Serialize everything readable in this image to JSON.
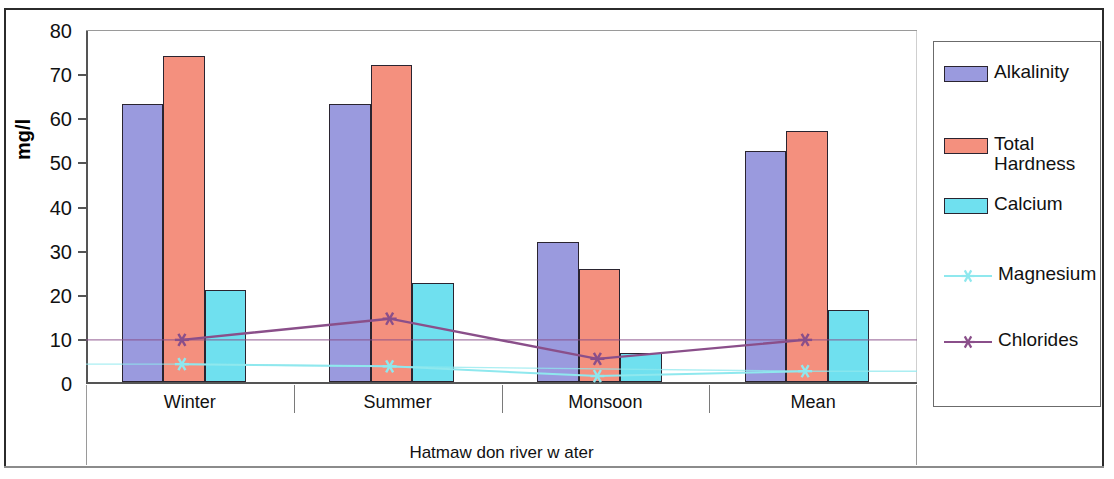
{
  "chart_data": {
    "type": "bar",
    "title": "",
    "xlabel": "Hatmaw don river w ater",
    "ylabel": "mg/l",
    "ylim": [
      0,
      80
    ],
    "yticks": [
      0,
      10,
      20,
      30,
      40,
      50,
      60,
      70,
      80
    ],
    "grid": false,
    "legend_position": "right",
    "categories": [
      "Winter",
      "Summer",
      "Monsoon",
      "Mean"
    ],
    "series": [
      {
        "name": "Alkalinity",
        "kind": "bar",
        "color": "#9a9ade",
        "values": [
          63,
          63,
          31.8,
          52.4
        ]
      },
      {
        "name": "Total Hardness",
        "kind": "bar",
        "color": "#f4907e",
        "values": [
          73.8,
          71.8,
          25.6,
          57
        ]
      },
      {
        "name": "Calcium",
        "kind": "bar",
        "color": "#6fe0ef",
        "values": [
          20.8,
          22.4,
          6.5,
          16.3
        ]
      },
      {
        "name": "Magnesium",
        "kind": "line",
        "color": "#8fe8ee",
        "values": [
          4.5,
          4,
          1.8,
          2.9
        ]
      },
      {
        "name": "Chlorides",
        "kind": "line",
        "color": "#8a4f8a",
        "values": [
          10,
          14.8,
          5.7,
          10
        ]
      }
    ]
  },
  "legend": {
    "items": [
      {
        "label": "Alkalinity",
        "marker": "swatch-alkalinity"
      },
      {
        "label": "Total\nHardness",
        "marker": "swatch-hardness"
      },
      {
        "label": "Calcium",
        "marker": "swatch-calcium"
      },
      {
        "label": "Magnesium",
        "marker": "line-marker-x"
      },
      {
        "label": "Chlorides",
        "marker": "line-marker-star"
      }
    ]
  }
}
